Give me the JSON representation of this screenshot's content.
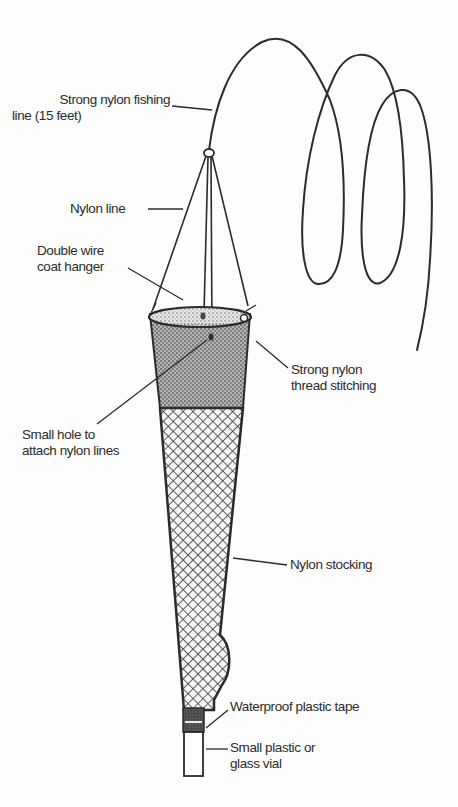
{
  "diagram": {
    "title": "",
    "colors": {
      "ink": "#2b2b2b",
      "background": "#fdfdfd",
      "stipple_fill": "#9a9a9a",
      "mesh_fill": "#f4f4f4"
    },
    "labels": {
      "fishing_line": {
        "line1": "Strong nylon fishing",
        "line2": "line (15 feet)"
      },
      "nylon_line": {
        "line1": "Nylon line"
      },
      "coat_hanger": {
        "line1": "Double wire",
        "line2": "coat hanger"
      },
      "thread_stitching": {
        "line1": "Strong nylon",
        "line2": "thread stitching"
      },
      "small_hole": {
        "line1": "Small hole to",
        "line2": "attach nylon lines"
      },
      "stocking": {
        "line1": "Nylon stocking"
      },
      "tape": {
        "line1": "Waterproof plastic tape"
      },
      "vial": {
        "line1": "Small plastic or",
        "line2": "glass vial"
      }
    },
    "components": [
      "Strong nylon fishing line (15 feet)",
      "Nylon line",
      "Double wire coat hanger",
      "Strong nylon thread stitching",
      "Small hole to attach nylon lines",
      "Nylon stocking",
      "Waterproof plastic tape",
      "Small plastic or glass vial"
    ]
  }
}
